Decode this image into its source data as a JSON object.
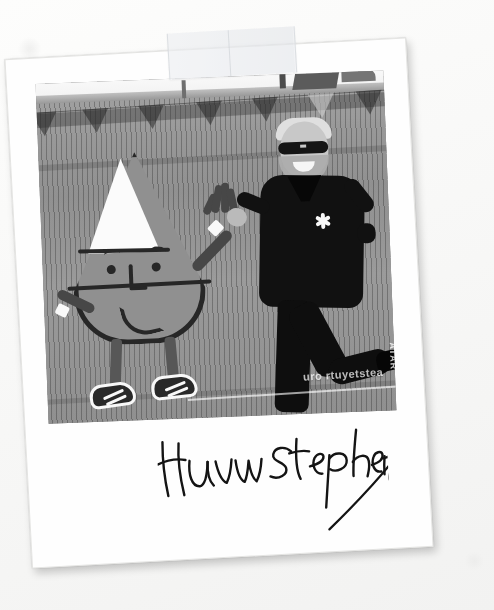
{
  "scene": {
    "type": "photograph",
    "medium": "instant-film polaroid print, taped to a white surface",
    "treatment": "black and white",
    "tilt_degrees": -3.1
  },
  "signature": {
    "name": "Huw Stephens",
    "ink_color": "#141414",
    "style": "handwritten marker, with long diagonal flourish stroke descending to the lower left"
  },
  "tape": {
    "label": "adhesive-tape-strip",
    "position": "top edge of polaroid",
    "color": "#eceef0"
  },
  "photo": {
    "subjects": [
      {
        "id": "mascot",
        "label": "candy-corn cone mascot cutout",
        "description": "large cartoon cone-shaped character painted on a grey reed windbreak, white triangular top, eyes, nose, smile, thin arms with white cuffs, thin legs and trainers",
        "body_color": "#8f8f8f",
        "outline_color": "#2c2c2c",
        "cone_color": "#f4f4f2"
      },
      {
        "id": "man",
        "label": "smiling man posing",
        "description": "bearded man in dark sunglasses and a dark zip jacket with a small white flower emblem, one hand raised, one leg kicked up",
        "jacket_color": "#171717",
        "emblem": "white-flower-badge"
      }
    ],
    "background": {
      "fence": "grey vertical reed windbreak fence",
      "bunting": "row of triangular bunting flags along the top",
      "rooftops": "distant roofline and chimneys against pale sky",
      "banner_text": "uro   rtuyetstea",
      "side_banner_text": "ATAR"
    },
    "bunting_flags": [
      {
        "x": 8,
        "shade": "dark"
      },
      {
        "x": 58,
        "shade": "dark"
      },
      {
        "x": 112,
        "shade": "dark"
      },
      {
        "x": 168,
        "shade": "dark"
      },
      {
        "x": 222,
        "shade": "dark"
      },
      {
        "x": 276,
        "shade": "light"
      },
      {
        "x": 326,
        "shade": "dark"
      }
    ]
  },
  "palette": {
    "page_background": "#fbfbfa",
    "polaroid_white": "#fefefe",
    "photo_midtone": "#8d8d8d",
    "ink": "#141414",
    "shadow": "rgba(0,0,0,0.20)"
  }
}
